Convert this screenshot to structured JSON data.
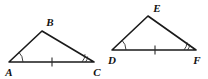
{
  "figure": {
    "background_color": "#ffffff",
    "stroke_color": "#1a1a1a",
    "mark_color": "#2b2b2b",
    "triangles": [
      {
        "name": "triangle-abc",
        "vertices": [
          {
            "label": "A",
            "x": 9,
            "y": 62,
            "label_x": 9,
            "label_y": 73
          },
          {
            "label": "B",
            "x": 42,
            "y": 31,
            "label_x": 50,
            "label_y": 23
          },
          {
            "label": "C",
            "x": 94,
            "y": 62,
            "label_x": 97,
            "label_y": 73
          }
        ],
        "base_tick": {
          "x": 52,
          "y": 62,
          "count": 1
        },
        "angle_marks": [
          {
            "at": "A",
            "arcs": 1
          },
          {
            "at": "C",
            "arcs": 2
          }
        ]
      },
      {
        "name": "triangle-def",
        "vertices": [
          {
            "label": "D",
            "x": 112,
            "y": 50,
            "label_x": 112,
            "label_y": 61
          },
          {
            "label": "E",
            "x": 148,
            "y": 16,
            "label_x": 157,
            "label_y": 9
          },
          {
            "label": "F",
            "x": 196,
            "y": 50,
            "label_x": 197,
            "label_y": 61
          }
        ],
        "base_tick": {
          "x": 155,
          "y": 50,
          "count": 1
        },
        "angle_marks": [
          {
            "at": "D",
            "arcs": 1
          },
          {
            "at": "F",
            "arcs": 2
          }
        ]
      }
    ],
    "labels": {
      "a": "A",
      "b": "B",
      "c": "C",
      "d": "D",
      "e": "E",
      "f": "F"
    }
  }
}
